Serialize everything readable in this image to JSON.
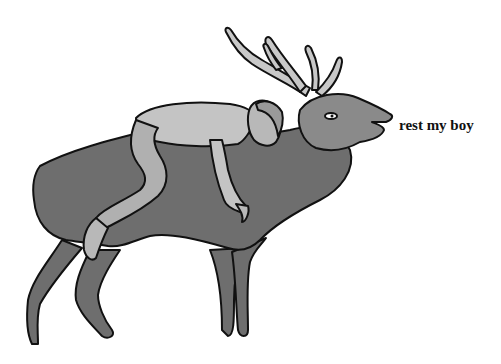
{
  "caption": "rest my boy",
  "colors": {
    "background": "#ffffff",
    "deer_body": "#6e6e6e",
    "deer_head": "#8a8a8a",
    "antlers": "#c8c8c8",
    "man_skin": "#c4c4c4",
    "man_limb": "#b0b0b0",
    "outline": "#111111"
  }
}
